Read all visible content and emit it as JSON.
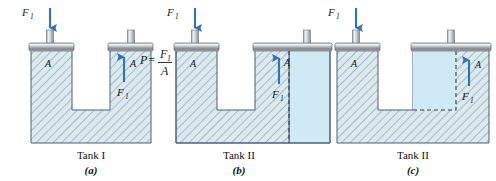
{
  "figure": {
    "background_color": "#ffffff"
  },
  "colors": {
    "fluid_hatched_fill": "#dce9ef",
    "fluid_plain_fill": "#cfe9f5",
    "hatch_line": "#7d9aa8",
    "outline": "#4a6270",
    "arrow_blue": "#2f73b8",
    "piston_gray_light": "#e8eaec",
    "piston_gray_mid": "#9aa0a6",
    "piston_gray_dark": "#6e7479",
    "text": "#111111",
    "dashed_line": "#33424c"
  },
  "panels": [
    {
      "id": "a",
      "tank_name": "Tank I",
      "panel_label": "(a)",
      "left_piston": {
        "force_label": "F",
        "force_subscript": "1",
        "arrow_direction": "down",
        "area_label": "A"
      },
      "right_piston": {
        "force_label": "F",
        "force_subscript": "1",
        "arrow_direction": "up",
        "area_label": "A"
      },
      "has_plain_fluid_region": false,
      "equation": {
        "lhs": "P",
        "equals": "=",
        "numerator": "F",
        "numerator_subscript": "1",
        "denominator": "A"
      }
    },
    {
      "id": "b",
      "tank_name": "Tank II",
      "panel_label": "(b)",
      "left_piston": {
        "force_label": "F",
        "force_subscript": "1",
        "arrow_direction": "down",
        "area_label": "A"
      },
      "right_piston": {
        "force_label": "F",
        "force_subscript": "1",
        "arrow_direction": "up",
        "area_label": "A"
      },
      "has_plain_fluid_region": true,
      "plain_region_note": "extra fluid right of dashed line, full height of right column",
      "equation": null
    },
    {
      "id": "c",
      "tank_name": "Tank II",
      "panel_label": "(c)",
      "left_piston": {
        "force_label": "F",
        "force_subscript": "1",
        "arrow_direction": "down",
        "area_label": "A"
      },
      "right_piston": {
        "force_label": "F",
        "force_subscript": "1",
        "arrow_direction": "up",
        "area_label": "A"
      },
      "has_plain_fluid_region": true,
      "plain_region_note": "plain fluid column bounded right and below by dashed line",
      "equation": null
    }
  ]
}
